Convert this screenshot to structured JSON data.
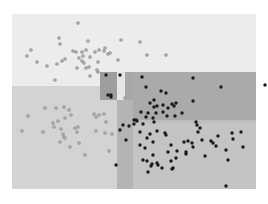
{
  "chart_data": {
    "type": "scatter",
    "title": "",
    "xlabel": "",
    "ylabel": "",
    "grid": false,
    "legend": null,
    "plot_area": {
      "x0": 12,
      "y0": 14,
      "x1": 256,
      "y1": 189
    },
    "regions": [
      {
        "x0": 12,
        "y0": 14,
        "x1": 256,
        "y1": 72,
        "color": "#ececec",
        "class": "light"
      },
      {
        "x0": 12,
        "y0": 86,
        "x1": 117,
        "y1": 189,
        "color": "#d3d3d3",
        "class": "light"
      },
      {
        "x0": 12,
        "y0": 72,
        "x1": 100,
        "y1": 86,
        "color": "#ececec",
        "class": "light"
      },
      {
        "x0": 100,
        "y0": 72,
        "x1": 117,
        "y1": 100,
        "color": "#9e9e9e",
        "class": "dark"
      },
      {
        "x0": 117,
        "y0": 72,
        "x1": 125,
        "y1": 100,
        "color": "#e6e6e6",
        "class": "light"
      },
      {
        "x0": 125,
        "y0": 72,
        "x1": 133,
        "y1": 100,
        "color": "#a8a8a8",
        "class": "dark"
      },
      {
        "x0": 100,
        "y0": 100,
        "x1": 117,
        "y1": 189,
        "color": "#d3d3d3",
        "class": "light"
      },
      {
        "x0": 117,
        "y0": 100,
        "x1": 133,
        "y1": 189,
        "color": "#b4b4b4",
        "class": "dark"
      },
      {
        "x0": 133,
        "y0": 72,
        "x1": 256,
        "y1": 120,
        "color": "#aaaaaa",
        "class": "dark"
      },
      {
        "x0": 133,
        "y0": 120,
        "x1": 256,
        "y1": 123,
        "color": "#bdbdbd",
        "class": "mixed"
      },
      {
        "x0": 133,
        "y0": 123,
        "x1": 256,
        "y1": 189,
        "color": "#c4c4c4",
        "class": "dark"
      }
    ],
    "series": [
      {
        "name": "class-light",
        "color": "#a9a9a9",
        "points": [
          [
            78,
            23
          ],
          [
            59,
            38
          ],
          [
            60,
            44
          ],
          [
            88,
            41
          ],
          [
            105,
            48
          ],
          [
            121,
            40
          ],
          [
            31,
            50
          ],
          [
            27,
            56
          ],
          [
            37,
            62
          ],
          [
            47,
            66
          ],
          [
            76,
            52
          ],
          [
            82,
            52
          ],
          [
            73,
            51
          ],
          [
            86,
            50
          ],
          [
            99,
            50
          ],
          [
            104,
            51
          ],
          [
            62,
            61
          ],
          [
            65,
            59
          ],
          [
            57,
            64
          ],
          [
            79,
            58
          ],
          [
            82,
            61
          ],
          [
            83,
            56
          ],
          [
            90,
            57
          ],
          [
            84,
            63
          ],
          [
            89,
            67
          ],
          [
            98,
            62
          ],
          [
            108,
            54
          ],
          [
            118,
            60
          ],
          [
            110,
            53
          ],
          [
            95,
            52
          ],
          [
            77,
            68
          ],
          [
            86,
            68
          ],
          [
            98,
            72
          ],
          [
            97,
            70
          ],
          [
            55,
            80
          ],
          [
            90,
            76
          ],
          [
            140,
            42
          ],
          [
            147,
            55
          ],
          [
            166,
            55
          ],
          [
            45,
            108
          ],
          [
            56,
            108
          ],
          [
            64,
            107
          ],
          [
            69,
            110
          ],
          [
            71,
            115
          ],
          [
            65,
            118
          ],
          [
            58,
            121
          ],
          [
            53,
            123
          ],
          [
            54,
            127
          ],
          [
            61,
            129
          ],
          [
            43,
            132
          ],
          [
            63,
            134
          ],
          [
            64,
            137
          ],
          [
            75,
            128
          ],
          [
            78,
            127
          ],
          [
            77,
            132
          ],
          [
            65,
            138
          ],
          [
            60,
            142
          ],
          [
            79,
            143
          ],
          [
            22,
            131
          ],
          [
            28,
            116
          ],
          [
            70,
            147
          ],
          [
            85,
            155
          ],
          [
            94,
            114
          ],
          [
            99,
            115
          ],
          [
            104,
            114
          ],
          [
            96,
            117
          ],
          [
            106,
            122
          ],
          [
            96,
            131
          ],
          [
            105,
            133
          ],
          [
            112,
            134
          ],
          [
            109,
            151
          ],
          [
            125,
            98
          ]
        ]
      },
      {
        "name": "class-dark",
        "color": "#1a1a1a",
        "points": [
          [
            106,
            75
          ],
          [
            120,
            75
          ],
          [
            108,
            95
          ],
          [
            111,
            95
          ],
          [
            111,
            97
          ],
          [
            142,
            77
          ],
          [
            193,
            78
          ],
          [
            146,
            87
          ],
          [
            161,
            91
          ],
          [
            166,
            93
          ],
          [
            150,
            103
          ],
          [
            163,
            105
          ],
          [
            172,
            104
          ],
          [
            174,
            106
          ],
          [
            168,
            108
          ],
          [
            157,
            106
          ],
          [
            154,
            100
          ],
          [
            154,
            107
          ],
          [
            141,
            112
          ],
          [
            148,
            113
          ],
          [
            156,
            113
          ],
          [
            163,
            112
          ],
          [
            176,
            103
          ],
          [
            182,
            113
          ],
          [
            167,
            116
          ],
          [
            146,
            117
          ],
          [
            153,
            118
          ],
          [
            154,
            122
          ],
          [
            134,
            120
          ],
          [
            137,
            121
          ],
          [
            175,
            116
          ],
          [
            196,
            122
          ],
          [
            221,
            87
          ],
          [
            193,
            101
          ],
          [
            265,
            85
          ],
          [
            197,
            125
          ],
          [
            140,
            132
          ],
          [
            150,
            134
          ],
          [
            165,
            133
          ],
          [
            166,
            135
          ],
          [
            147,
            138
          ],
          [
            153,
            142
          ],
          [
            171,
            145
          ],
          [
            184,
            142
          ],
          [
            188,
            141
          ],
          [
            192,
            143
          ],
          [
            202,
            140
          ],
          [
            211,
            141
          ],
          [
            200,
            128
          ],
          [
            198,
            132
          ],
          [
            140,
            145
          ],
          [
            145,
            148
          ],
          [
            168,
            152
          ],
          [
            177,
            151
          ],
          [
            176,
            158
          ],
          [
            186,
            152
          ],
          [
            193,
            147
          ],
          [
            153,
            155
          ],
          [
            157,
            163
          ],
          [
            158,
            165
          ],
          [
            162,
            168
          ],
          [
            173,
            168
          ],
          [
            186,
            154
          ],
          [
            171,
            161
          ],
          [
            172,
            169
          ],
          [
            232,
            133
          ],
          [
            233,
            139
          ],
          [
            241,
            132
          ],
          [
            243,
            147
          ],
          [
            226,
            150
          ],
          [
            228,
            160
          ],
          [
            143,
            160
          ],
          [
            147,
            161
          ],
          [
            151,
            166
          ],
          [
            205,
            156
          ],
          [
            226,
            186
          ],
          [
            148,
            172
          ],
          [
            152,
            164
          ],
          [
            213,
            143
          ],
          [
            216,
            146
          ],
          [
            218,
            136
          ],
          [
            157,
            131
          ],
          [
            143,
            124
          ],
          [
            129,
            126
          ],
          [
            134,
            124
          ],
          [
            136,
            120
          ],
          [
            120,
            130
          ],
          [
            126,
            140
          ],
          [
            116,
            165
          ],
          [
            123,
            125
          ]
        ]
      }
    ]
  }
}
